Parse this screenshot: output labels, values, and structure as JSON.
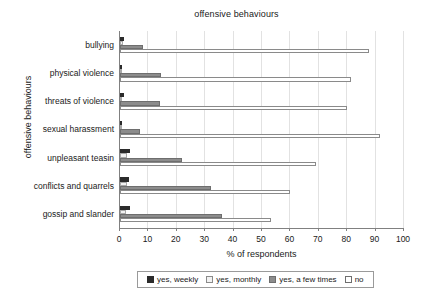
{
  "chart_data": {
    "type": "bar",
    "orientation": "horizontal",
    "title": "offensive behaviours",
    "xlabel": "% of respondents",
    "ylabel": "offensive behaviours",
    "xlim": [
      0,
      100
    ],
    "xticks": [
      0,
      10,
      20,
      30,
      40,
      50,
      60,
      70,
      80,
      90,
      100
    ],
    "grid": true,
    "legend_position": "bottom",
    "categories": [
      "bullying",
      "physical violence",
      "threats of violence",
      "sexual harassment",
      "unpleasant teasin",
      "conflicts and quarrels",
      "gossip and slander"
    ],
    "series": [
      {
        "name": "yes, weekly",
        "color": "#2b2b2b",
        "values": [
          1.5,
          0.7,
          1.3,
          0.3,
          3.5,
          3.2,
          3.6
        ]
      },
      {
        "name": "yes, monthly",
        "color": "#f2f2f2",
        "values": [
          0.9,
          0.6,
          0.8,
          0.4,
          2.6,
          2.4,
          2.2
        ]
      },
      {
        "name": "yes, a few times",
        "color": "#8c8c8c",
        "values": [
          8.0,
          14.3,
          14.0,
          7.0,
          22.0,
          32.0,
          36.0
        ]
      },
      {
        "name": "no",
        "color": "#ffffff",
        "values": [
          87.5,
          81.5,
          80.0,
          91.5,
          69.0,
          60.0,
          53.0
        ]
      }
    ]
  }
}
